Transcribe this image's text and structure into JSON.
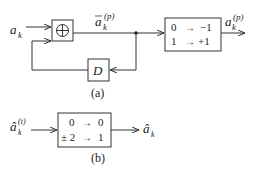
{
  "diagram_a": {
    "caption": "(a)",
    "input_label": {
      "base": "a",
      "sub": "k"
    },
    "sum_node": {
      "symbol": "⊕"
    },
    "intermediate_label": {
      "base": "a",
      "bar": true,
      "sub": "k",
      "sup": "(p)"
    },
    "delay_block": {
      "label": "D"
    },
    "mapping_block": {
      "rows": [
        {
          "from": "0",
          "arrow": "→",
          "to": "−1"
        },
        {
          "from": "1",
          "arrow": "→",
          "to": "+1"
        }
      ]
    },
    "output_label": {
      "base": "a",
      "sub": "k",
      "sup": "(p)"
    }
  },
  "diagram_b": {
    "caption": "(b)",
    "input_label": {
      "base": "â",
      "sub": "k",
      "sup": "(t)"
    },
    "mapping_block": {
      "rows": [
        {
          "from": "0",
          "arrow": "→",
          "to": "0"
        },
        {
          "from": "± 2",
          "arrow": "→",
          "to": "1"
        }
      ]
    },
    "output_label": {
      "base": "â",
      "sub": "k"
    }
  }
}
